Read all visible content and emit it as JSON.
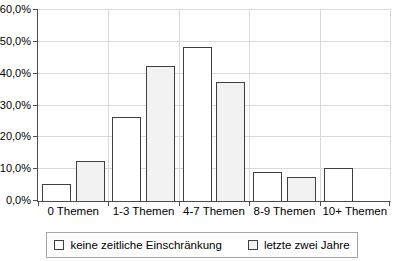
{
  "chart_data": {
    "type": "bar",
    "title": "",
    "xlabel": "",
    "ylabel": "",
    "categories": [
      "0 Themen",
      "1-3 Themen",
      "4-7 Themen",
      "8-9 Themen",
      "10+ Themen"
    ],
    "series": [
      {
        "name": "keine zeitliche Einschränkung",
        "fill": "#ffffff",
        "values": [
          5.5,
          26.5,
          48.5,
          9.0,
          10.5
        ]
      },
      {
        "name": "letzte zwei Jahre",
        "fill": "#f2f2f2",
        "values": [
          12.5,
          42.5,
          37.5,
          7.5,
          0.0
        ]
      }
    ],
    "y_axis": {
      "min": 0,
      "max": 60,
      "step": 10,
      "tick_labels": [
        "0,0%",
        "10,0%",
        "20,0%",
        "30,0%",
        "40,0%",
        "50,0%",
        "60,0%"
      ]
    },
    "grid": true,
    "legend_position": "bottom",
    "colors": {
      "bar_border": "#3f3f3f",
      "gridline": "#d9d9d9",
      "axis": "#4d4d4d",
      "text": "#000000",
      "legend_border": "#a6a6a6",
      "background": "#ffffff"
    }
  }
}
